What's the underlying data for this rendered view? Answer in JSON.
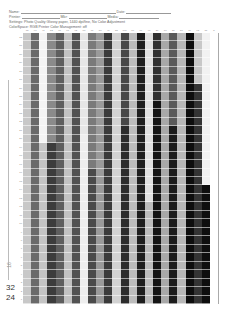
{
  "form": {
    "name_label": "Name:",
    "date_label": "Date:",
    "printer_label": "Printer:",
    "mkr_label": "Mkr:",
    "media_label": "Media:",
    "settings_line": "Settings: Photo Quality Glossy paper, 1440 dpi/fine, No Color Adjustment",
    "colorspace_line": "ColorSpace: RGB   Printer Color Management: off"
  },
  "side_labels": {
    "small": "16",
    "label_a": "32",
    "label_b": "24"
  },
  "column_headers": [
    "13",
    "90",
    "41",
    "52",
    "68",
    "87",
    "92",
    "88",
    "71",
    "58",
    "46",
    "35",
    "100",
    "80",
    "60",
    "40",
    "20",
    "10",
    "30",
    "50",
    "70",
    "95",
    "15",
    "5"
  ],
  "row_labels": [
    "32",
    "31",
    "30",
    "29",
    "28",
    "27",
    "26",
    "25",
    "24",
    "23",
    "22",
    "21",
    "20",
    "19",
    "18",
    "17",
    "16",
    "15",
    "14",
    "13",
    "12",
    "11",
    "10",
    "9",
    "8",
    "7",
    "6",
    "5",
    "4",
    "3",
    "2",
    "1"
  ],
  "grid": {
    "columns": 24,
    "rows": 32,
    "column_tones": [
      {
        "top": "#c8c8c8",
        "bottom": "#c0c0c0",
        "switch_row": 32
      },
      {
        "top": "#6a6a6a",
        "bottom": "#626262",
        "switch_row": 32
      },
      {
        "top": "#f4f4f4",
        "bottom": "#c4c4c4",
        "switch_row": 13
      },
      {
        "top": "#8a8a8a",
        "bottom": "#3c3c3c",
        "switch_row": 13
      },
      {
        "top": "#5e5e5e",
        "bottom": "#5a5a5a",
        "switch_row": 32
      },
      {
        "top": "#c2c2c2",
        "bottom": "#c2c2c2",
        "switch_row": 32
      },
      {
        "top": "#525252",
        "bottom": "#585858",
        "switch_row": 32
      },
      {
        "top": "#e6e6e6",
        "bottom": "#eeeeee",
        "switch_row": 12
      },
      {
        "top": "#7a7a7a",
        "bottom": "#4a4a4a",
        "switch_row": 16
      },
      {
        "top": "#9a9a9a",
        "bottom": "#a8a8a8",
        "switch_row": 32
      },
      {
        "top": "#3a3a3a",
        "bottom": "#3c3c3c",
        "switch_row": 32
      },
      {
        "top": "#d2d2d2",
        "bottom": "#cccccc",
        "switch_row": 32
      },
      {
        "top": "#484848",
        "bottom": "#2c2c2c",
        "switch_row": 11
      },
      {
        "top": "#bcbcbc",
        "bottom": "#bcbcbc",
        "switch_row": 32
      },
      {
        "top": "#1e1e1e",
        "bottom": "#1a1a1a",
        "switch_row": 32
      },
      {
        "top": "#e0e0e0",
        "bottom": "#bdbdbd",
        "switch_row": 20
      },
      {
        "top": "#303030",
        "bottom": "#141414",
        "switch_row": 8
      },
      {
        "top": "#a8a8a8",
        "bottom": "#9e9e9e",
        "switch_row": 32
      },
      {
        "top": "#5a5a5a",
        "bottom": "#1c1c1c",
        "switch_row": 11
      },
      {
        "top": "#b8b8b8",
        "bottom": "#b0b0b0",
        "switch_row": 32
      },
      {
        "top": "#0e0e0e",
        "bottom": "#141414",
        "switch_row": 32
      },
      {
        "top": "#c8c8c8",
        "bottom": "#343434",
        "switch_row": 6
      },
      {
        "top": "#f2f2f2",
        "bottom": "#0e0e0e",
        "switch_row": 18
      },
      {
        "top": "#ffffff",
        "bottom": "#ffffff",
        "switch_row": 32
      }
    ]
  }
}
